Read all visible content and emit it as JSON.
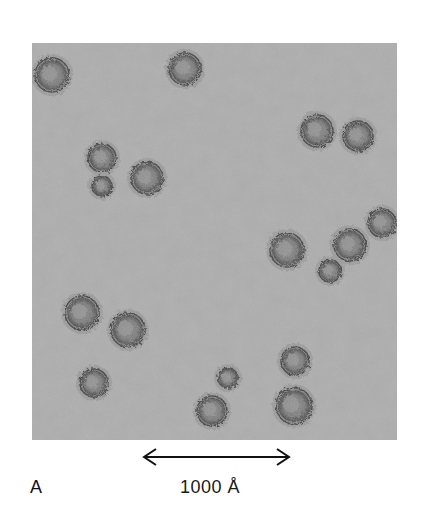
{
  "figure": {
    "panel_label": "A",
    "scale_bar": {
      "label": "1000 Å",
      "value": 1000,
      "unit": "Å"
    },
    "image": {
      "description": "Negative-stain electron micrograph showing roughly spherical particles scattered on a gray background",
      "background_color": "#a9a9a9",
      "particle_color": "#6e6e6e",
      "particle_edge_color": "#3c3c3c",
      "particles": [
        {
          "x": 20,
          "y": 32,
          "r": 17
        },
        {
          "x": 153,
          "y": 26,
          "r": 16
        },
        {
          "x": 285,
          "y": 88,
          "r": 16
        },
        {
          "x": 326,
          "y": 93,
          "r": 15
        },
        {
          "x": 70,
          "y": 115,
          "r": 14
        },
        {
          "x": 115,
          "y": 135,
          "r": 16
        },
        {
          "x": 70,
          "y": 143,
          "r": 10
        },
        {
          "x": 255,
          "y": 207,
          "r": 17
        },
        {
          "x": 318,
          "y": 202,
          "r": 16
        },
        {
          "x": 350,
          "y": 180,
          "r": 14
        },
        {
          "x": 298,
          "y": 228,
          "r": 11
        },
        {
          "x": 50,
          "y": 270,
          "r": 17
        },
        {
          "x": 96,
          "y": 287,
          "r": 17
        },
        {
          "x": 62,
          "y": 340,
          "r": 14
        },
        {
          "x": 196,
          "y": 335,
          "r": 10
        },
        {
          "x": 180,
          "y": 368,
          "r": 15
        },
        {
          "x": 263,
          "y": 318,
          "r": 14
        },
        {
          "x": 262,
          "y": 363,
          "r": 18
        }
      ]
    }
  }
}
